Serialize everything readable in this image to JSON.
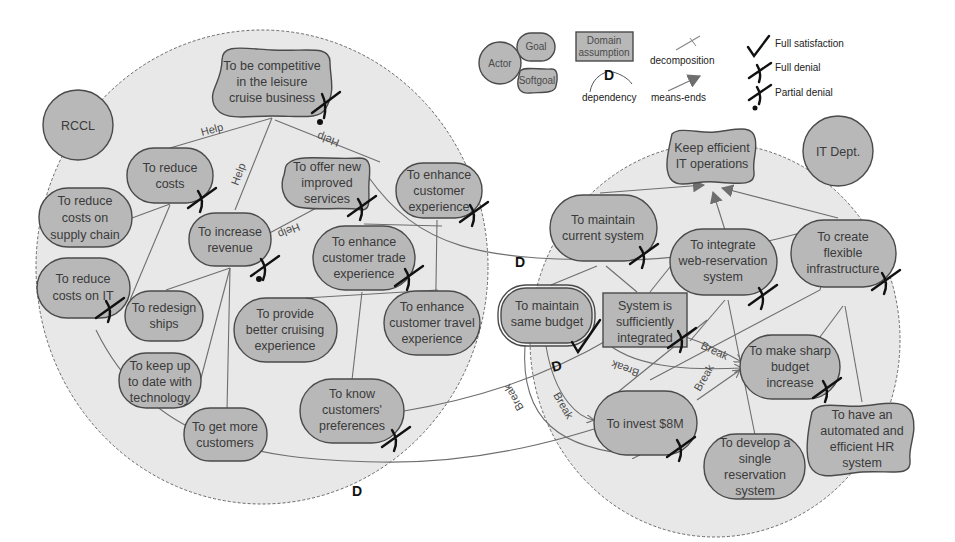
{
  "legend": {
    "actor": "Actor",
    "goal": "Goal",
    "softgoal": "Softgoal",
    "domain_assumption_line1": "Domain",
    "domain_assumption_line2": "assumption",
    "dependency": "dependency",
    "decomposition": "decomposition",
    "means_ends": "means-ends",
    "full_satisfaction": "Full satisfaction",
    "full_denial": "Full denial",
    "partial_denial": "Partial denial",
    "d_symbol": "D"
  },
  "actors": {
    "rccl": "RCCL",
    "it_dept": "IT Dept."
  },
  "rccl_nodes": {
    "competitive": [
      "To be competitive",
      "in the leisure",
      "cruise business"
    ],
    "reduce_costs": [
      "To reduce",
      "costs"
    ],
    "reduce_supply": [
      "To reduce",
      "costs on",
      "supply chain"
    ],
    "reduce_it": [
      "To reduce",
      "costs on IT"
    ],
    "increase_revenue": [
      "To increase",
      "revenue"
    ],
    "offer_services": [
      "To offer new",
      "improved",
      "services"
    ],
    "enhance_exp": [
      "To enhance",
      "customer",
      "experience"
    ],
    "enhance_trade": [
      "To enhance",
      "customer  trade",
      "experience"
    ],
    "redesign_ships": [
      "To redesign",
      "ships"
    ],
    "better_cruising": [
      "To provide",
      "better cruising",
      "experience"
    ],
    "enhance_travel": [
      "To enhance",
      "customer travel",
      "experience"
    ],
    "keep_up": [
      "To keep up",
      "to date with",
      "technology"
    ],
    "more_customers": [
      "To get more",
      "customers"
    ],
    "know_prefs": [
      "To know",
      "customers'",
      "preferences"
    ]
  },
  "it_nodes": {
    "keep_efficient": [
      "Keep efficient",
      "IT operations"
    ],
    "maintain_current": [
      "To maintain",
      "current system"
    ],
    "integrate_web": [
      "To integrate",
      "web-reservation",
      "system"
    ],
    "flexible_infra": [
      "To create",
      "flexible",
      "infrastructure"
    ],
    "maintain_budget": [
      "To maintain",
      "same budget"
    ],
    "sufficiently_integrated": [
      "System is",
      "sufficiently",
      "integrated"
    ],
    "sharp_budget": [
      "To make sharp",
      "budget",
      "increase"
    ],
    "invest": [
      "To invest $8M"
    ],
    "single_reservation": [
      "To develop a",
      "single",
      "reservation",
      "system"
    ],
    "automated_hr": [
      "To have an",
      "automated and",
      "efficient HR",
      "system"
    ]
  },
  "links": {
    "help": "Help",
    "break": "Break",
    "dependency": "D"
  }
}
